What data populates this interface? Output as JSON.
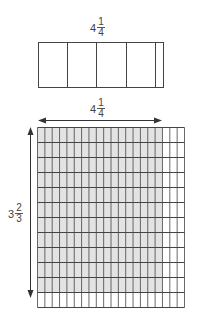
{
  "top_bar": {
    "label": {
      "whole": "4",
      "numerator": "1",
      "denominator": "4"
    },
    "whole_units": 4,
    "partial_fraction": 0.25
  },
  "area_model": {
    "width_label": {
      "whole": "4",
      "numerator": "1",
      "denominator": "4"
    },
    "height_label": {
      "whole": "3",
      "numerator": "2",
      "denominator": "3"
    },
    "total_columns": 20,
    "shaded_columns": 17,
    "total_rows": 12,
    "shaded_rows": 11,
    "shade_color": "#e3e3e3",
    "line_color": "#444444"
  }
}
